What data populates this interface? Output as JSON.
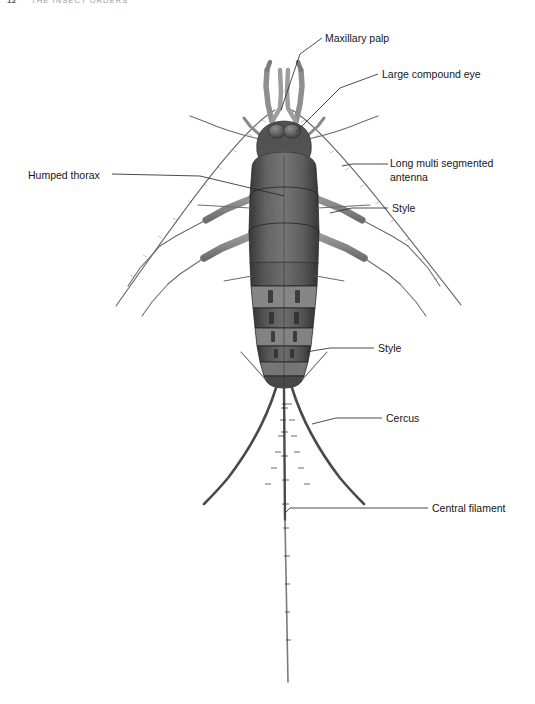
{
  "page": {
    "header_page_number": "12",
    "header_title": "THE INSECT ORDERS",
    "background_color": "#ffffff",
    "width": 535,
    "height": 704
  },
  "figure": {
    "body_color": "#4a4a4a",
    "appendage_color": "#6a6d72",
    "leader_color": "#2b2b2b"
  },
  "labels": [
    {
      "id": "maxillary-palp",
      "text": "Maxillary palp",
      "x": 325,
      "y": 32,
      "align": "left"
    },
    {
      "id": "large-compound-eye",
      "text": "Large compound eye",
      "x": 382,
      "y": 68,
      "align": "left"
    },
    {
      "id": "long-antenna-1",
      "text": "Long multi segmented",
      "x": 390,
      "y": 158,
      "align": "left"
    },
    {
      "id": "long-antenna-2",
      "text": "antenna",
      "x": 390,
      "y": 172,
      "align": "left"
    },
    {
      "id": "humped-thorax",
      "text": "Humped thorax",
      "x": 28,
      "y": 169,
      "align": "left"
    },
    {
      "id": "style-upper",
      "text": "Style",
      "x": 392,
      "y": 202,
      "align": "left"
    },
    {
      "id": "style-lower",
      "text": "Style",
      "x": 378,
      "y": 342,
      "align": "left"
    },
    {
      "id": "cercus",
      "text": "Cercus",
      "x": 386,
      "y": 412,
      "align": "left"
    },
    {
      "id": "central-filament",
      "text": "Central filament",
      "x": 432,
      "y": 502,
      "align": "left"
    }
  ],
  "anatomy_parts": [
    "maxillary-palp",
    "large-compound-eye",
    "long-multi-segmented-antenna",
    "humped-thorax",
    "style",
    "cercus",
    "central-filament"
  ]
}
